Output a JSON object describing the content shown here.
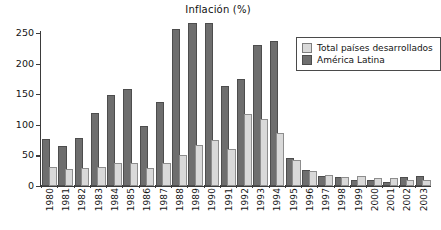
{
  "chart_data": {
    "type": "bar",
    "title": "Inflación (%)",
    "xlabel": "",
    "ylabel": "",
    "ylim": [
      0,
      250
    ],
    "yticks": [
      0,
      50,
      100,
      150,
      200,
      250
    ],
    "grid": false,
    "legend_position": "top-right",
    "categories": [
      "1980",
      "1981",
      "1982",
      "1983",
      "1984",
      "1985",
      "1986",
      "1987",
      "1988",
      "1989",
      "1990",
      "1991",
      "1992",
      "1993",
      "1994",
      "1995",
      "1996",
      "1997",
      "1998",
      "1999",
      "2000",
      "2001",
      "2002",
      "2003"
    ],
    "series": [
      {
        "name": "América Latina",
        "color": "#6e6e6e",
        "values": [
          73,
          62,
          75,
          116,
          145,
          155,
          95,
          134,
          253,
          263,
          263,
          160,
          172,
          227,
          234,
          42,
          23,
          13,
          11,
          6,
          6,
          4,
          11,
          13
        ]
      },
      {
        "name": "Total países desarrollados",
        "color": "#d9d9d9",
        "values": [
          28,
          24,
          26,
          28,
          34,
          34,
          26,
          34,
          48,
          64,
          72,
          57,
          115,
          107,
          84,
          40,
          21,
          15,
          11,
          13,
          10,
          10,
          7,
          7
        ]
      }
    ]
  },
  "legend": {
    "entries": [
      {
        "label": "Total países desarrollados",
        "swatch": "light"
      },
      {
        "label": "América Latina",
        "swatch": "dark"
      }
    ]
  },
  "colors": {
    "series_light": "#d9d9d9",
    "series_dark": "#6e6e6e",
    "axis": "#3b3b3b",
    "text": "#141414",
    "background": "#ffffff"
  }
}
